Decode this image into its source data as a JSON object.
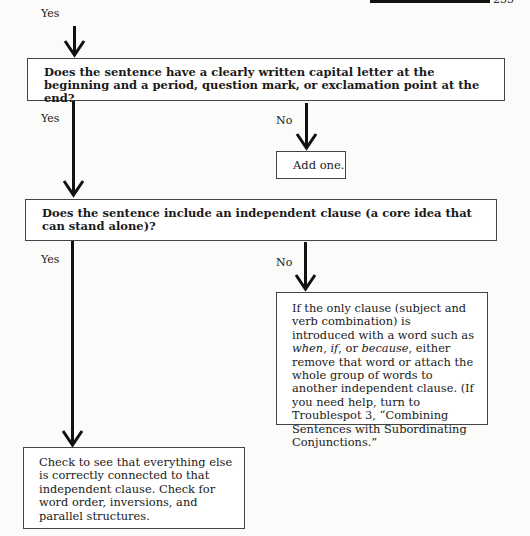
{
  "page": {
    "header_bar": true,
    "page_number": "255"
  },
  "flowchart": {
    "start_label": "Yes",
    "q1": {
      "text": "Does the sentence have a clearly written capital letter at the beginning and a period, question mark, or exclamation point at the end?",
      "yes_label": "Yes",
      "no_label": "No",
      "no_action": "Add one."
    },
    "q2": {
      "text": "Does the sentence include an independent clause (a core idea that can stand alone)?",
      "yes_label": "Yes",
      "no_label": "No",
      "no_action": {
        "part1": "If the only clause (subject and verb combination) is introduced with a word such as ",
        "em1": "when",
        "sep1": ", ",
        "em2": "if",
        "sep2": ", or ",
        "em3": "because",
        "part2": ", either remove that word or attach the whole group of words to another independent clause. (If you need help, turn to Troublespot 3, “Combining Sentences with Subordinating Conjunctions.”"
      },
      "yes_action": "Check to see that everything else is correctly connected to that independent clause. Check for word order, inversions, and parallel structures."
    }
  }
}
